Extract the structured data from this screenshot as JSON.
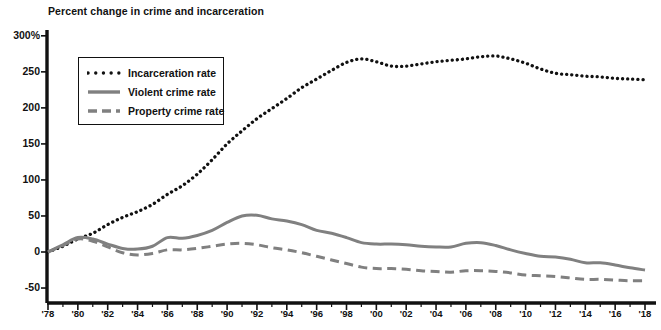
{
  "chart_data": {
    "type": "line",
    "title": "Percent change in crime and incarceration",
    "xlabel": "",
    "ylabel": "",
    "ylim": [
      -75,
      300
    ],
    "xlim": [
      1978,
      2018
    ],
    "grid": false,
    "legend_position": "upper-left-inside",
    "y_ticks": [
      "300%",
      "250",
      "200",
      "150",
      "100",
      "50",
      "0",
      "-50"
    ],
    "y_tick_values": [
      300,
      250,
      200,
      150,
      100,
      50,
      0,
      -50
    ],
    "x_ticks": [
      "'78",
      "'80",
      "'82",
      "'84",
      "'86",
      "'88",
      "'90",
      "'92",
      "'94",
      "'96",
      "'98",
      "'00",
      "'02",
      "'04",
      "'06",
      "'08",
      "'10",
      "'12",
      "'14",
      "'16",
      "'18"
    ],
    "x": [
      1978,
      1979,
      1980,
      1981,
      1982,
      1983,
      1984,
      1985,
      1986,
      1987,
      1988,
      1989,
      1990,
      1991,
      1992,
      1993,
      1994,
      1995,
      1996,
      1997,
      1998,
      1999,
      2000,
      2001,
      2002,
      2003,
      2004,
      2005,
      2006,
      2007,
      2008,
      2009,
      2010,
      2011,
      2012,
      2013,
      2014,
      2015,
      2016,
      2017,
      2018
    ],
    "series": [
      {
        "name": "Incarceration rate",
        "style": "dotted",
        "color": "#111111",
        "values": [
          0,
          8,
          18,
          26,
          38,
          48,
          56,
          66,
          80,
          92,
          108,
          128,
          150,
          168,
          185,
          199,
          213,
          228,
          240,
          252,
          263,
          268,
          264,
          258,
          258,
          261,
          264,
          266,
          268,
          271,
          272,
          268,
          262,
          254,
          248,
          246,
          244,
          243,
          241,
          240,
          239
        ]
      },
      {
        "name": "Violent crime rate",
        "style": "solid",
        "color": "#808080",
        "values": [
          0,
          10,
          20,
          18,
          11,
          5,
          4,
          8,
          20,
          19,
          23,
          30,
          41,
          50,
          51,
          46,
          43,
          38,
          30,
          26,
          20,
          13,
          11,
          11,
          10,
          8,
          7,
          7,
          12,
          13,
          9,
          3,
          -2,
          -6,
          -7,
          -10,
          -15,
          -15,
          -18,
          -22,
          -25
        ]
      },
      {
        "name": "Property crime rate",
        "style": "dashed",
        "color": "#808080",
        "values": [
          0,
          9,
          18,
          15,
          7,
          -1,
          -4,
          -2,
          3,
          3,
          5,
          8,
          11,
          12,
          10,
          6,
          3,
          -1,
          -6,
          -11,
          -16,
          -21,
          -23,
          -23,
          -24,
          -26,
          -27,
          -28,
          -26,
          -26,
          -27,
          -29,
          -32,
          -33,
          -34,
          -36,
          -38,
          -38,
          -39,
          -40,
          -40
        ]
      }
    ],
    "legend": [
      {
        "label": "Incarceration rate",
        "style": "dotted",
        "color": "#111111"
      },
      {
        "label": "Violent crime rate",
        "style": "solid",
        "color": "#808080"
      },
      {
        "label": "Property crime rate",
        "style": "dashed",
        "color": "#808080"
      }
    ]
  }
}
